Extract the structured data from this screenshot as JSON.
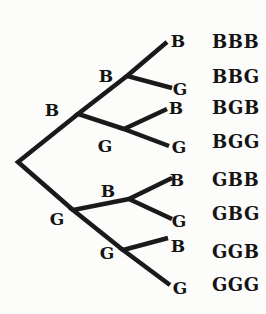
{
  "tree": {
    "level1": [
      {
        "label": "B"
      },
      {
        "label": "G"
      }
    ],
    "level2": [
      {
        "label": "B"
      },
      {
        "label": "G"
      },
      {
        "label": "B"
      },
      {
        "label": "G"
      }
    ],
    "level3": [
      {
        "label": "B"
      },
      {
        "label": "G"
      },
      {
        "label": "B"
      },
      {
        "label": "G"
      },
      {
        "label": "B"
      },
      {
        "label": "G"
      },
      {
        "label": "B"
      },
      {
        "label": "G"
      }
    ],
    "outcomes": [
      "BBB",
      "BBG",
      "BGB",
      "BGG",
      "GBB",
      "GBG",
      "GGB",
      "GGG"
    ]
  },
  "colors": {
    "background": "#fcfcfa",
    "line": "#1a1a1a",
    "text": "#141414"
  }
}
